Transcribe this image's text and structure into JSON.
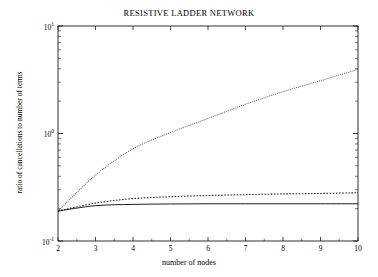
{
  "chart_data": {
    "type": "line",
    "title": "RESISTIVE LADDER NETWORK",
    "xlabel": "number of nodes",
    "ylabel": "ratio of cancellations to number of terms",
    "xscale": "linear",
    "yscale": "log",
    "xlim": [
      2,
      10
    ],
    "ylim": [
      0.1,
      10
    ],
    "grid": false,
    "legend": "none",
    "xticks": [
      "2",
      "3",
      "4",
      "5",
      "6",
      "7",
      "8",
      "9",
      "10"
    ],
    "xtick_values": [
      2,
      3,
      4,
      5,
      6,
      7,
      8,
      9,
      10
    ],
    "ytick_labels": [
      "10-1",
      "100",
      "101"
    ],
    "ytick_mantissas": [
      "10",
      "10",
      "10"
    ],
    "ytick_exponents": [
      "-1",
      "0",
      "1"
    ],
    "ytick_values": [
      0.1,
      1,
      10
    ],
    "x": [
      2,
      3,
      4,
      5,
      6,
      7,
      8,
      9,
      10
    ],
    "series": [
      {
        "name": "upper curve",
        "style": "dotted-fine",
        "color": "#555555",
        "values": [
          0.19,
          0.41,
          0.72,
          1.02,
          1.38,
          1.87,
          2.45,
          3.1,
          3.95
        ]
      },
      {
        "name": "middle curve",
        "style": "dotted-coarse",
        "color": "#222222",
        "values": [
          0.19,
          0.225,
          0.248,
          0.258,
          0.265,
          0.27,
          0.274,
          0.277,
          0.281
        ]
      },
      {
        "name": "lower curve",
        "style": "solid",
        "color": "#111111",
        "values": [
          0.19,
          0.213,
          0.219,
          0.221,
          0.222,
          0.222,
          0.222,
          0.222,
          0.222
        ]
      }
    ]
  }
}
